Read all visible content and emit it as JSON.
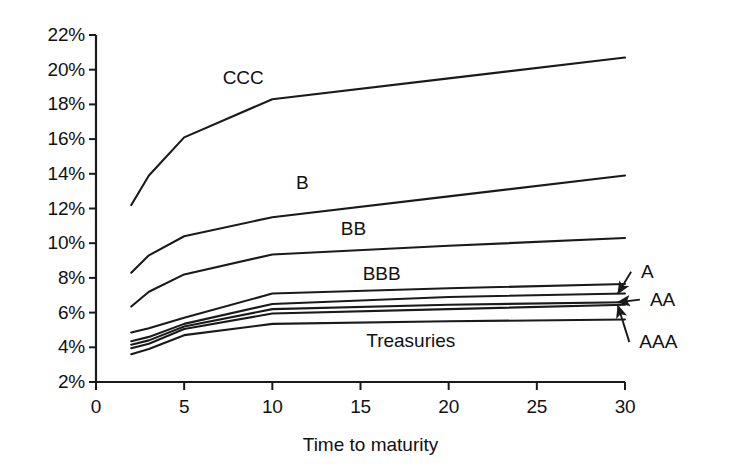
{
  "chart_data": {
    "type": "line",
    "title": "",
    "xlabel": "Time to maturity",
    "ylabel": "",
    "xlim": [
      0,
      30
    ],
    "ylim": [
      2,
      22
    ],
    "grid": false,
    "legend_position": "inline-labels",
    "x_ticks": [
      "0",
      "5",
      "10",
      "15",
      "20",
      "25",
      "30"
    ],
    "x_tick_values": [
      0,
      5,
      10,
      15,
      20,
      25,
      30
    ],
    "y_ticks": [
      "2%",
      "4%",
      "6%",
      "8%",
      "10%",
      "12%",
      "14%",
      "16%",
      "18%",
      "20%",
      "22%"
    ],
    "y_tick_values": [
      2,
      4,
      6,
      8,
      10,
      12,
      14,
      16,
      18,
      20,
      22
    ],
    "x": [
      2,
      3,
      5,
      10,
      20,
      30
    ],
    "series": [
      {
        "name": "CCC",
        "values": [
          12.2,
          13.9,
          16.1,
          18.3,
          19.5,
          20.7
        ]
      },
      {
        "name": "B",
        "values": [
          8.3,
          9.3,
          10.4,
          11.5,
          12.7,
          13.9
        ]
      },
      {
        "name": "BB",
        "values": [
          6.35,
          7.2,
          8.2,
          9.35,
          9.85,
          10.3
        ]
      },
      {
        "name": "BBB",
        "values": [
          4.85,
          5.1,
          5.7,
          7.1,
          7.4,
          7.65
        ]
      },
      {
        "name": "A",
        "values": [
          4.35,
          4.6,
          5.35,
          6.5,
          6.9,
          7.1
        ]
      },
      {
        "name": "AA",
        "values": [
          4.15,
          4.4,
          5.2,
          6.2,
          6.45,
          6.6
        ]
      },
      {
        "name": "AAA",
        "values": [
          3.95,
          4.2,
          5.05,
          5.95,
          6.2,
          6.45
        ]
      },
      {
        "name": "Treasuries",
        "values": [
          3.6,
          3.9,
          4.7,
          5.35,
          5.5,
          5.6
        ]
      }
    ],
    "inline_labels": [
      {
        "text": "CCC",
        "x": 8.35,
        "y": 19.55
      },
      {
        "text": "B",
        "x": 11.7,
        "y": 13.45
      },
      {
        "text": "BB",
        "x": 14.6,
        "y": 10.8
      },
      {
        "text": "BBB",
        "x": 16.2,
        "y": 8.25
      },
      {
        "text": "Treasuries",
        "x": 17.85,
        "y": 4.35
      }
    ],
    "callouts": [
      {
        "text": "A",
        "label_x": 30.8,
        "label_y": 8.35,
        "arrow_to_x": 29.6,
        "arrow_to_y": 7.1
      },
      {
        "text": "AA",
        "label_x": 31.3,
        "label_y": 6.75,
        "arrow_to_x": 29.6,
        "arrow_to_y": 6.6
      },
      {
        "text": "AAA",
        "label_x": 30.7,
        "label_y": 4.3,
        "arrow_to_x": 29.6,
        "arrow_to_y": 6.4
      }
    ],
    "colors": {
      "line": "#1a1a1a",
      "axis": "#1a1a1a",
      "text": "#111111",
      "background": "#ffffff"
    }
  }
}
